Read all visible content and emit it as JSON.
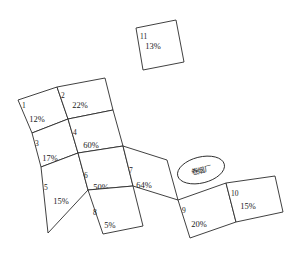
{
  "diagram": {
    "title": "",
    "type": "land-parcel-map",
    "stroke_color": "#2b2b2b",
    "fill_color": "#ffffff",
    "background_color": "#ffffff"
  },
  "parcels": [
    {
      "id": "1",
      "percent": "12%",
      "points": "18,100 57,87 68,119 32,133",
      "id_x": 22,
      "id_y": 108,
      "pct_x": 37,
      "pct_y": 122
    },
    {
      "id": "2",
      "percent": "22%",
      "points": "57,87 105,78 113,110 68,119",
      "id_x": 61,
      "id_y": 98,
      "pct_x": 80,
      "pct_y": 108
    },
    {
      "id": "3",
      "percent": "17%",
      "points": "32,133 68,119 78,153 41,167",
      "id_x": 35,
      "id_y": 146,
      "pct_x": 50,
      "pct_y": 161
    },
    {
      "id": "4",
      "percent": "60%",
      "points": "68,119 113,110 123,146 78,153",
      "id_x": 73,
      "id_y": 135,
      "pct_x": 91,
      "pct_y": 148
    },
    {
      "id": "5",
      "percent": "15%",
      "points": "41,167 78,153 88,190 48,233",
      "id_x": 44,
      "id_y": 190,
      "pct_x": 61,
      "pct_y": 204
    },
    {
      "id": "6",
      "percent": "50%",
      "points": "78,153 123,146 133,186 88,190",
      "id_x": 84,
      "id_y": 178,
      "pct_x": 101,
      "pct_y": 190
    },
    {
      "id": "7",
      "percent": "64%",
      "points": "123,146 167,160 178,200 133,186",
      "id_x": 129,
      "id_y": 173,
      "pct_x": 144,
      "pct_y": 188
    },
    {
      "id": "8",
      "percent": "5%",
      "points": "88,190 133,186 143,226 103,234",
      "id_x": 93,
      "id_y": 215,
      "pct_x": 110,
      "pct_y": 228
    },
    {
      "id": "9",
      "percent": "20%",
      "points": "178,200 226,183 236,222 190,238",
      "id_x": 182,
      "id_y": 213,
      "pct_x": 199,
      "pct_y": 227
    },
    {
      "id": "10",
      "percent": "15%",
      "points": "226,183 275,176 283,212 236,222",
      "id_x": 231,
      "id_y": 196,
      "pct_x": 248,
      "pct_y": 209
    },
    {
      "id": "11",
      "percent": "13%",
      "points": "136,28 176,20 184,62 143,70",
      "id_x": 140,
      "id_y": 39,
      "pct_x": 153,
      "pct_y": 49
    }
  ],
  "annotations": [
    {
      "name": "factory-ellipse",
      "label": "卷烟厂",
      "cx": 201,
      "cy": 170,
      "rx": 24,
      "ry": 13,
      "rotation": -14,
      "label_x": 201,
      "label_y": 173
    }
  ]
}
